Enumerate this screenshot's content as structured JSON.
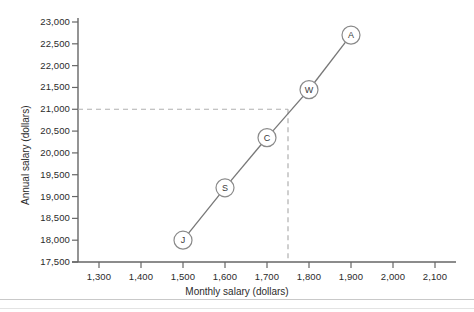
{
  "chart_data": {
    "type": "scatter",
    "title": "",
    "xlabel": "Monthly salary (dollars)",
    "ylabel": "Annual salary (dollars)",
    "xlim": [
      1250,
      2150
    ],
    "ylim": [
      17500,
      23000
    ],
    "grid": false,
    "legend": "none",
    "x_ticks": [
      "1,300",
      "1,400",
      "1,500",
      "1,600",
      "1,700",
      "1,800",
      "1,900",
      "2,000",
      "2,100"
    ],
    "x_tick_values": [
      1300,
      1400,
      1500,
      1600,
      1700,
      1800,
      1900,
      2000,
      2100
    ],
    "y_ticks": [
      "17,500",
      "18,000",
      "18,500",
      "19,000",
      "19,500",
      "20,000",
      "20,500",
      "21,000",
      "21,500",
      "22,000",
      "22,500",
      "23,000"
    ],
    "y_tick_values": [
      17500,
      18000,
      18500,
      19000,
      19500,
      20000,
      20500,
      21000,
      21500,
      22000,
      22500,
      23000
    ],
    "points": [
      {
        "label": "J",
        "x": 1500,
        "y": 18000
      },
      {
        "label": "S",
        "x": 1600,
        "y": 19200
      },
      {
        "label": "C",
        "x": 1700,
        "y": 20350
      },
      {
        "label": "W",
        "x": 1800,
        "y": 21450
      },
      {
        "label": "A",
        "x": 1900,
        "y": 22700
      }
    ],
    "reference_lines": [
      {
        "orientation": "horizontal",
        "value": 21000,
        "style": "dashed"
      },
      {
        "orientation": "vertical",
        "value": 1750,
        "style": "dashed"
      }
    ],
    "colors": {
      "axis": "#666666",
      "line": "#777777",
      "marker_stroke": "#8a8a8a",
      "dashed": "#b0b0b0",
      "text": "#2b2b2b"
    }
  }
}
